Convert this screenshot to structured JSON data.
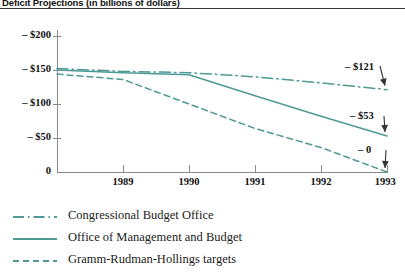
{
  "title": "Deficit Projections (in billions of dollars)",
  "axis": {
    "y_ticks": [
      {
        "label": "– $200",
        "value": -200
      },
      {
        "label": "– $150",
        "value": -150
      },
      {
        "label": "– $100",
        "value": -100
      },
      {
        "label": "– $50",
        "value": -50
      },
      {
        "label": "0",
        "value": 0
      }
    ],
    "x_ticks": [
      "1988",
      "1989",
      "1990",
      "1991",
      "1992",
      "1993"
    ]
  },
  "annotations": [
    {
      "label": "– $121",
      "series": "Congressional Budget Office"
    },
    {
      "label": "– $53",
      "series": "Office of Management and Budget"
    },
    {
      "label": "– 0",
      "series": "Gramm-Rudman-Hollings targets"
    }
  ],
  "legend": [
    {
      "label": "Congressional Budget Office",
      "style": "dash-dot"
    },
    {
      "label": "Office of Management and Budget",
      "style": "solid"
    },
    {
      "label": "Gramm-Rudman-Hollings targets",
      "style": "dashed"
    }
  ],
  "colors": {
    "series": "#4e9a93",
    "axis": "#8a8a8a",
    "rule": "#3a3a3a",
    "text": "#111111"
  },
  "chart_data": {
    "type": "line",
    "title": "Deficit Projections (in billions of dollars)",
    "xlabel": "",
    "ylabel": "",
    "x": [
      1988,
      1989,
      1990,
      1991,
      1992,
      1993
    ],
    "ylim": [
      -212,
      0
    ],
    "xlim": [
      1988,
      1993
    ],
    "grid": false,
    "legend_position": "below-left",
    "series": [
      {
        "name": "Congressional Budget Office",
        "style": "dash-dot",
        "values": [
          -152,
          -148,
          -146,
          -140,
          -131,
          -121
        ]
      },
      {
        "name": "Office of Management and Budget",
        "style": "solid",
        "values": [
          -150,
          -146,
          -143,
          -112,
          -82,
          -53
        ]
      },
      {
        "name": "Gramm-Rudman-Hollings targets",
        "style": "dashed",
        "values": [
          -144,
          -136,
          -100,
          -64,
          -36,
          0
        ]
      }
    ]
  }
}
